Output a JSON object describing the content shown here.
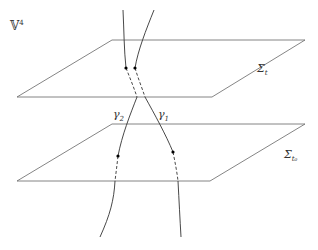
{
  "diagram": {
    "space_label": {
      "base": "𝕍",
      "sup": "4"
    },
    "planes": [
      {
        "name": "upper",
        "label_base": "Σ",
        "label_sub": "t"
      },
      {
        "name": "lower",
        "label_base": "Σ",
        "label_sub": "t₀"
      }
    ],
    "curves": [
      {
        "name": "gamma-1",
        "label_base": "γ",
        "label_sub": "1"
      },
      {
        "name": "gamma-2",
        "label_base": "γ",
        "label_sub": "2"
      }
    ],
    "colors": {
      "line": "#555555",
      "curve": "#333333",
      "dot": "#000000"
    }
  }
}
